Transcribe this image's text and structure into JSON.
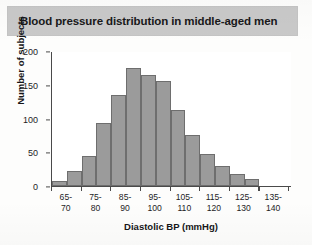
{
  "figure": {
    "title": "Blood pressure distribution in middle-aged men"
  },
  "chart_data": {
    "type": "bar",
    "title": "Blood pressure distribution in middle-aged men",
    "xlabel": "Diastolic BP (mmHg)",
    "ylabel": "Number of subjects",
    "ylim": [
      0,
      200
    ],
    "yticks": [
      0,
      50,
      100,
      150,
      200
    ],
    "grid": false,
    "legend": null,
    "bin_width": 5,
    "bin_edges": [
      60,
      65,
      70,
      75,
      80,
      85,
      90,
      95,
      100,
      105,
      110,
      115,
      120,
      125,
      130
    ],
    "categories": [
      "60-65",
      "65-70",
      "70-75",
      "75-80",
      "80-85",
      "85-90",
      "90-95",
      "95-100",
      "100-105",
      "105-110",
      "110-115",
      "115-120",
      "120-125",
      "125-130"
    ],
    "values": [
      8,
      22,
      45,
      93,
      135,
      175,
      165,
      155,
      112,
      75,
      48,
      30,
      18,
      10
    ],
    "xtick_labels": [
      "65-\n70",
      "75-\n80",
      "85-\n90",
      "95-\n100",
      "105-\n110",
      "115-\n120",
      "125-\n130",
      "135-\n140"
    ],
    "xtick_labels_lines": [
      [
        "65-",
        "70"
      ],
      [
        "75-",
        "80"
      ],
      [
        "85-",
        "90"
      ],
      [
        "95-",
        "100"
      ],
      [
        "105-",
        "110"
      ],
      [
        "115-",
        "120"
      ],
      [
        "125-",
        "130"
      ],
      [
        "135-",
        "140"
      ]
    ]
  },
  "colors": {
    "bar_fill": "#9b9b9b",
    "bar_edge": "#6e6e6e",
    "axis": "#4a4a4a",
    "title_banner": "#c9c9c9",
    "text": "#18181a",
    "plot_background": "#ffffff"
  }
}
